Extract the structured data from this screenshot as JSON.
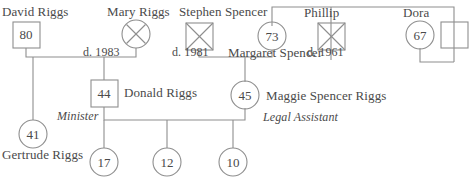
{
  "diagram": {
    "line_color": "#8e8e8e",
    "text_color": "#4a4a4a",
    "background": "#ffffff"
  },
  "persons": [
    {
      "id": "david",
      "name": "David Riggs",
      "age": "80",
      "shape": "square",
      "deceased": false,
      "role": ""
    },
    {
      "id": "mary",
      "name": "Mary Riggs",
      "age": "",
      "shape": "circle",
      "deceased": true,
      "role": ""
    },
    {
      "id": "stephen",
      "name": "Stephen Spencer",
      "age": "",
      "shape": "square",
      "deceased": true,
      "role": ""
    },
    {
      "id": "margaret",
      "name": "Margaret Spencer",
      "age": "73",
      "shape": "circle",
      "deceased": false,
      "role": ""
    },
    {
      "id": "phillip",
      "name": "Phillip",
      "age": "",
      "shape": "square",
      "deceased": true,
      "role": ""
    },
    {
      "id": "dora",
      "name": "Dora",
      "age": "67",
      "shape": "circle",
      "deceased": false,
      "role": ""
    },
    {
      "id": "doraspouse",
      "name": "",
      "age": "",
      "shape": "square",
      "deceased": false,
      "role": ""
    },
    {
      "id": "donald",
      "name": "Donald Riggs",
      "age": "44",
      "shape": "square",
      "deceased": false,
      "role": "Minister"
    },
    {
      "id": "maggie",
      "name": "Maggie Spencer Riggs",
      "age": "45",
      "shape": "circle",
      "deceased": false,
      "role": "Legal Assistant"
    },
    {
      "id": "gertrude",
      "name": "Gertrude Riggs",
      "age": "41",
      "shape": "circle",
      "deceased": false,
      "role": ""
    },
    {
      "id": "child1",
      "name": "",
      "age": "17",
      "shape": "circle",
      "deceased": false,
      "role": ""
    },
    {
      "id": "child2",
      "name": "",
      "age": "12",
      "shape": "circle",
      "deceased": false,
      "role": ""
    },
    {
      "id": "child3",
      "name": "",
      "age": "10",
      "shape": "circle",
      "deceased": false,
      "role": ""
    }
  ],
  "labels": {
    "david_name": "David Riggs",
    "david_age": "80",
    "mary_name": "Mary Riggs",
    "riggs_death": "d. 1983",
    "stephen_name": "Stephen Spencer",
    "stephen_death": "d. 1981",
    "margaret_name": "Margaret Spencer",
    "margaret_age": "73",
    "phillip_name": "Phillip",
    "phillip_death": "d. 1961",
    "dora_name": "Dora",
    "dora_age": "67",
    "donald_name": "Donald Riggs",
    "donald_age": "44",
    "donald_role": "Minister",
    "maggie_name": "Maggie Spencer Riggs",
    "maggie_age": "45",
    "maggie_role": "Legal Assistant",
    "gertrude_name": "Gertrude Riggs",
    "gertrude_age": "41",
    "child1_age": "17",
    "child2_age": "12",
    "child3_age": "10"
  }
}
